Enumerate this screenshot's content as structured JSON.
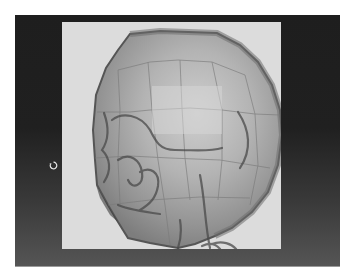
{
  "viewport": {
    "background_color": "#1f1f1f",
    "canvas_color": "#dcdcdc",
    "model": {
      "subject": "translucent low-poly head over skull reference",
      "view": "side profile facing left",
      "mesh_color": "#8a8a8a",
      "edge_color": "#6a6a6a"
    },
    "cursor": {
      "icon": "rotate-icon"
    }
  }
}
